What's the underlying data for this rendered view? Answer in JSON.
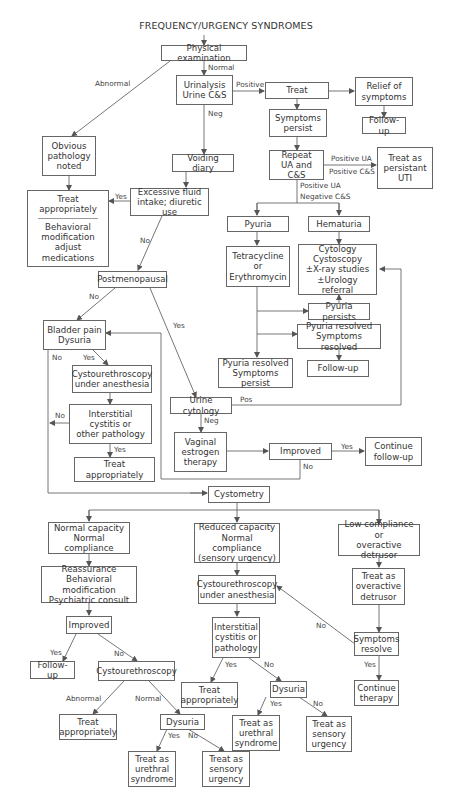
{
  "title": "FREQUENCY/URGENCY SYNDROMES",
  "nodes": {
    "physical_exam": "Physical examination",
    "urinalysis": "Urinalysis\nUrine C&S",
    "treat": "Treat",
    "relief": "Relief of\nsymptoms",
    "followup_1": "Follow-up",
    "symptoms_persist": "Symptoms\npersist",
    "repeat_ua": "Repeat\nUA and C&S",
    "persistant_uti": "Treat as\npersistant\nUTI",
    "obvious_pathology": "Obvious\npathology\nnoted",
    "voiding_diary": "Voiding diary",
    "treat_appropriately_top_a": "Treat\nappropriately",
    "treat_appropriately_top_b": "Behavioral\nmodification\nadjust medications",
    "excessive_fluid": "Excessive fluid\nintake; diuretic use",
    "pyuria": "Pyuria",
    "hematuria": "Hematuria",
    "tetracycline": "Tetracycline\nor\nErythromycin",
    "cytology_box": "Cytology\nCystoscopy\n±X-ray studies\n±Urology referral",
    "pyuria_persists": "Pyuria persists",
    "pyuria_resolved_symptoms_resolved": "Pyuria resolved\nSymptoms resolved",
    "followup_2": "Follow-up",
    "pyuria_resolved_symptoms_persist": "Pyuria resolved\nSymptoms persist",
    "postmenopausal": "Postmenopausal",
    "bladder_pain": "Bladder pain\nDysuria",
    "cysto_anesthesia_1": "Cystourethroscopy\nunder anesthesia",
    "interstitial_1": "Interstitial\ncystitis or\nother pathology",
    "treat_appropriately_2": "Treat\nappropriately",
    "urine_cytology": "Urine cytology",
    "vaginal_estrogen": "Vaginal\nestrogen\ntherapy",
    "improved_1": "Improved",
    "continue_followup": "Continue\nfollow-up",
    "cystometry": "Cystometry",
    "normal_capacity": "Normal capacity\nNormal compliance",
    "reduced_capacity": "Reduced capacity\nNormal compliance\n(sensory urgency)",
    "low_compliance": "Low compliance or\noveractive detrusor",
    "reassurance": "Reassurance\nBehavioral modification\nPsychiatric consult",
    "cysto_anesthesia_2": "Cystourethroscopy\nunder anesthesia",
    "treat_overactive": "Treat as\noveractive\ndetrusor",
    "improved_2": "Improved",
    "interstitial_2": "Interstitial\ncystitis or\npathology",
    "symptoms_resolve": "Symptoms\nresolve",
    "followup_3": "Follow-up",
    "cystourethroscopy": "Cystourethroscopy",
    "treat_appropriately_3": "Treat\nappropriately",
    "dysuria_1": "Dysuria",
    "continue_therapy": "Continue\ntherapy",
    "treat_appropriately_4": "Treat\nappropriately",
    "dysuria_2": "Dysuria",
    "urethral_1": "Treat as\nurethral\nsyndrome",
    "sensory_1": "Treat as\nsensory\nurgency",
    "urethral_2": "Treat as\nurethral\nsyndrome",
    "sensory_2": "Treat as\nsensory\nurgency"
  },
  "labels": {
    "normal": "Normal",
    "abnormal": "Abnormal",
    "positive": "Positive",
    "neg": "Neg",
    "positive_ua": "Positive UA",
    "positive_cs": "Positive C&S",
    "positive_ua_2": "Positive UA",
    "negative_cs": "Negative C&S",
    "yes_fluid": "Yes",
    "no_fluid": "No",
    "no_postmeno": "No",
    "yes_postmeno": "Yes",
    "no_bladder": "No",
    "yes_bladder": "Yes",
    "no_interstitial": "No",
    "yes_interstitial": "Yes",
    "pos_cytology": "Pos",
    "neg_cytology": "Neg",
    "yes_improved": "Yes",
    "no_improved": "No",
    "yes_improved2": "Yes",
    "no_improved2": "No",
    "abnormal_2": "Abnormal",
    "normal_2": "Normal",
    "yes_ic2": "Yes",
    "no_ic2": "No",
    "no_symptoms": "No",
    "yes_symptoms": "Yes",
    "yes_dys1": "Yes",
    "no_dys1": "No",
    "yes_dys2": "Yes",
    "no_dys2": "No"
  }
}
